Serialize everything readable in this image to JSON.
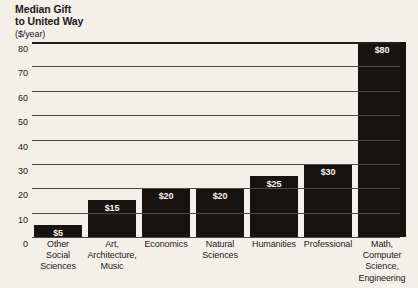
{
  "chart_data": {
    "type": "bar",
    "title": "Median Gift to United Way",
    "title_line1": "Median Gift",
    "title_line2": "to United Way",
    "subtitle": "($/year)",
    "xlabel": "",
    "ylabel": "",
    "ylim": [
      0,
      80
    ],
    "yticks": [
      0,
      10,
      20,
      30,
      40,
      50,
      60,
      70,
      80
    ],
    "ytick_labels": [
      "0",
      "10",
      "20",
      "30",
      "40",
      "50",
      "60",
      "70",
      "80"
    ],
    "grid": true,
    "legend": "none",
    "categories": [
      "Other Social Sciences",
      "Art, Architecture, Music",
      "Economics",
      "Natural Sciences",
      "Humanities",
      "Professional",
      "Math, Computer Science, Engineering"
    ],
    "category_lines": [
      [
        "Other",
        "Social",
        "Sciences"
      ],
      [
        "Art,",
        "Architecture,",
        "Music"
      ],
      [
        "Economics"
      ],
      [
        "Natural",
        "Sciences"
      ],
      [
        "Humanities"
      ],
      [
        "Professional"
      ],
      [
        "Math,",
        "Computer",
        "Science,",
        "Engineering"
      ]
    ],
    "values": [
      5,
      15,
      20,
      20,
      25,
      30,
      80
    ],
    "value_labels": [
      "$5",
      "$15",
      "$20",
      "$20",
      "$25",
      "$30",
      "$80"
    ],
    "colors": {
      "bar": "#17140f",
      "background": "#f3f0e8",
      "gridline": "#4d4840",
      "text": "#1c1a18",
      "value_label": "#f6f3ec"
    }
  }
}
